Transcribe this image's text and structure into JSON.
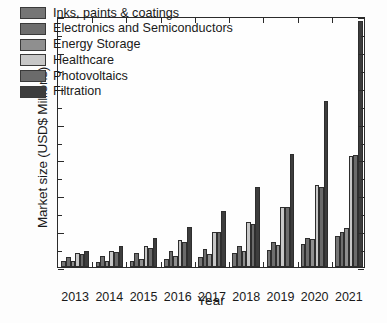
{
  "chart_data": {
    "type": "bar",
    "title": "",
    "subtitle": "",
    "xlabel": "Year",
    "ylabel": "Market size (USD$ Millions)",
    "categories": [
      "2013",
      "2014",
      "2015",
      "2016",
      "2017",
      "2018",
      "2019",
      "2020",
      "2021"
    ],
    "ylim": [
      0,
      35
    ],
    "yticks": [
      0,
      5,
      10,
      15,
      20,
      25,
      30,
      35
    ],
    "ytick_labels": [
      "0",
      "5",
      "10",
      "15",
      "20",
      "25",
      "30",
      "35"
    ],
    "yminor_step": 2.5,
    "grid": false,
    "legend_position": "upper-left",
    "series": [
      {
        "name": "Inks, paints & coatings",
        "color": "#757575",
        "values": [
          0.8,
          0.65,
          0.85,
          1.1,
          1.35,
          1.9,
          2.4,
          3.2,
          4.3
        ]
      },
      {
        "name": "Electronics and Semiconductors",
        "color": "#6e6e6e",
        "values": [
          1.4,
          1.6,
          1.9,
          2.2,
          2.55,
          3.0,
          3.5,
          4.1,
          4.9
        ]
      },
      {
        "name": "Energy Storage",
        "color": "#8f8f8f",
        "values": [
          0.85,
          0.9,
          1.1,
          1.5,
          1.85,
          2.3,
          3.1,
          3.9,
          5.5
        ]
      },
      {
        "name": "Healthcare",
        "color": "#c7c7c7",
        "values": [
          1.9,
          2.3,
          3.0,
          3.8,
          4.9,
          6.3,
          8.4,
          11.4,
          15.5
        ]
      },
      {
        "name": "Photovoltaics",
        "color": "#6b6b6b",
        "values": [
          1.75,
          2.1,
          2.6,
          3.5,
          4.85,
          6.0,
          8.3,
          11.2,
          15.6
        ]
      },
      {
        "name": "Filtration",
        "color": "#3d3d3d",
        "values": [
          2.2,
          2.9,
          4.05,
          5.6,
          7.8,
          11.1,
          15.8,
          23.1,
          34.3
        ]
      }
    ]
  },
  "axes": {
    "frame_color": "#2b2b2b"
  }
}
